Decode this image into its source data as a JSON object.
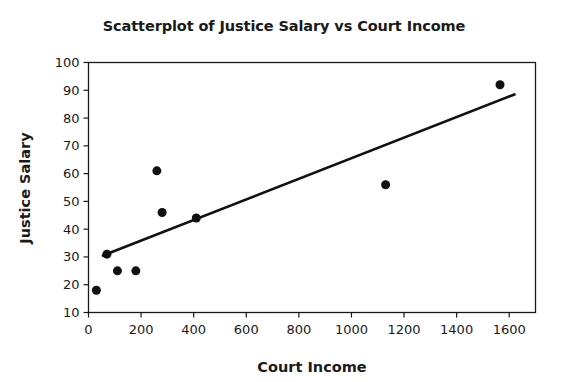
{
  "chart_data": {
    "type": "scatter",
    "title": "Scatterplot of Justice Salary vs Court Income",
    "xlabel": "Court Income",
    "ylabel": "Justice Salary",
    "xlim": [
      0,
      1700
    ],
    "ylim": [
      10,
      100
    ],
    "xticks": [
      0,
      200,
      400,
      600,
      800,
      1000,
      1200,
      1400,
      1600
    ],
    "xtick_labels": [
      "0",
      "200",
      "400",
      "600",
      "800",
      "1000",
      "1200",
      "1400",
      "1600"
    ],
    "yticks": [
      10,
      20,
      30,
      40,
      50,
      60,
      70,
      80,
      90,
      100
    ],
    "ytick_labels": [
      "10",
      "20",
      "30",
      "40",
      "50",
      "60",
      "70",
      "80",
      "90",
      "100"
    ],
    "grid": false,
    "legend": null,
    "points": [
      {
        "x": 30,
        "y": 18
      },
      {
        "x": 70,
        "y": 31
      },
      {
        "x": 110,
        "y": 25
      },
      {
        "x": 180,
        "y": 25
      },
      {
        "x": 260,
        "y": 61
      },
      {
        "x": 280,
        "y": 46
      },
      {
        "x": 410,
        "y": 44
      },
      {
        "x": 1130,
        "y": 56
      },
      {
        "x": 1565,
        "y": 92
      }
    ],
    "marker": {
      "shape": "circle",
      "color": "#111111",
      "size": 9
    },
    "trendline": {
      "type": "linear-fit",
      "color": "#111111",
      "x_start": 55,
      "y_start": 30.5,
      "x_end": 1620,
      "y_end": 88.5
    }
  }
}
